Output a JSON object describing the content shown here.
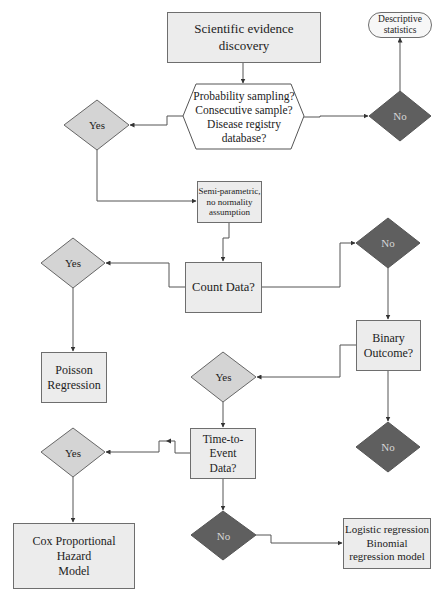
{
  "diagram": {
    "nodes": {
      "start": {
        "label_line1": "Scientific evidence",
        "label_line2": "discovery",
        "shape": "rectangle"
      },
      "sampling_question": {
        "lines": [
          "Probability sampling?",
          "Consecutive sample?",
          "Disease registry",
          "database?"
        ],
        "shape": "hexagon"
      },
      "descriptive": {
        "label_line1": "Descriptive",
        "label_line2": "statistics",
        "shape": "rounded-rectangle"
      },
      "yes1": {
        "label": "Yes",
        "shape": "diamond"
      },
      "no1": {
        "label": "No",
        "shape": "diamond"
      },
      "semi_param": {
        "lines": [
          "Semi-parametric,",
          "no normality",
          "assumption"
        ],
        "shape": "rectangle"
      },
      "count_data": {
        "label": "Count Data?",
        "shape": "rectangle"
      },
      "yes2": {
        "label": "Yes",
        "shape": "diamond"
      },
      "no2": {
        "label": "No",
        "shape": "diamond"
      },
      "poisson": {
        "label_line1": "Poisson",
        "label_line2": "Regression",
        "shape": "rectangle"
      },
      "binary": {
        "label_line1": "Binary",
        "label_line2": "Outcome?",
        "shape": "rectangle"
      },
      "yes3": {
        "label": "Yes",
        "shape": "diamond"
      },
      "no3": {
        "label": "No",
        "shape": "diamond"
      },
      "time_event": {
        "label_line1": "Time-to-Event",
        "label_line2": "Data?",
        "shape": "rectangle"
      },
      "yes4": {
        "label": "Yes",
        "shape": "diamond"
      },
      "no4": {
        "label": "No",
        "shape": "diamond"
      },
      "cox": {
        "label_line1": "Cox Proportional Hazard",
        "label_line2": "Model",
        "shape": "rectangle"
      },
      "logistic": {
        "lines": [
          "Logistic regression",
          "Binomial",
          "regression model"
        ],
        "shape": "rectangle"
      }
    },
    "edges": [
      {
        "from": "start",
        "to": "sampling_question"
      },
      {
        "from": "sampling_question",
        "to": "yes1"
      },
      {
        "from": "sampling_question",
        "to": "no1"
      },
      {
        "from": "no1",
        "to": "descriptive"
      },
      {
        "from": "yes1",
        "to": "semi_param"
      },
      {
        "from": "semi_param",
        "to": "count_data"
      },
      {
        "from": "count_data",
        "to": "yes2"
      },
      {
        "from": "count_data",
        "to": "no2"
      },
      {
        "from": "yes2",
        "to": "poisson"
      },
      {
        "from": "no2",
        "to": "binary"
      },
      {
        "from": "binary",
        "to": "yes3"
      },
      {
        "from": "binary",
        "to": "no3"
      },
      {
        "from": "yes3",
        "to": "time_event"
      },
      {
        "from": "time_event",
        "to": "yes4"
      },
      {
        "from": "time_event",
        "to": "no4"
      },
      {
        "from": "yes4",
        "to": "cox"
      },
      {
        "from": "no4",
        "to": "logistic"
      }
    ],
    "colors": {
      "box_fill": "#ececec",
      "box_border": "#6e6e6e",
      "yes_fill": "#d4d4d4",
      "no_fill": "#5f5f5f",
      "no_text": "#d6d6d6",
      "connector": "#555555"
    }
  }
}
